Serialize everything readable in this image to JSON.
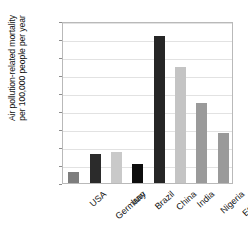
{
  "chart_data": {
    "type": "bar",
    "title": "",
    "xlabel": "",
    "ylabel": "Air pollution-related mortality per 100,000 people per year",
    "ylabel_lines": [
      "Air pollution-related mortality",
      "per 100,000 people per year"
    ],
    "categories": [
      "USA",
      "Germany",
      "Iran",
      "Brazil",
      "China",
      "India",
      "Nigeria",
      "Ethiopia"
    ],
    "values": [
      12,
      32,
      35,
      21,
      163,
      129,
      89,
      56
    ],
    "colors": [
      "#7d7d7d",
      "#2b2b2b",
      "#c9c9c9",
      "#0d0d0d",
      "#262626",
      "#c4c4c4",
      "#9a9a9a",
      "#9a9a9a"
    ],
    "ylim": [
      0,
      180
    ],
    "yticks": [
      0,
      20,
      40,
      60,
      80,
      100,
      120,
      140,
      160,
      180
    ],
    "ytick_labels": [
      "0",
      "20",
      "40",
      "60",
      "80",
      "100",
      "120",
      "140",
      "160",
      "180"
    ],
    "grid": true,
    "legend": false,
    "legend_position": "none",
    "axis_color": "#b9b9b9",
    "grid_color": "#e2e2e2",
    "text_color": "#111111",
    "background": "#ffffff"
  }
}
